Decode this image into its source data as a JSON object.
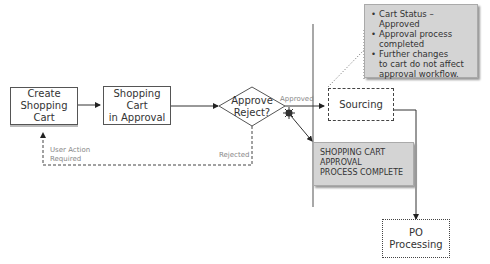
{
  "nodes": {
    "create_cart": {
      "label_line1": "Create",
      "label_line2": "Shopping Cart"
    },
    "cart_in_approval": {
      "label_line1": "Shopping Cart",
      "label_line2": "in Approval"
    },
    "decision": {
      "label_line1": "Approve",
      "label_line2": "Reject?"
    },
    "sourcing": {
      "label": "Sourcing"
    },
    "po_processing": {
      "label": "PO Processing"
    },
    "complete": {
      "line1": "SHOPPING CART",
      "line2": "APPROVAL",
      "line3": "PROCESS COMPLETE"
    }
  },
  "edges": {
    "approved_label": "Approved",
    "rejected_label": "Rejected",
    "user_action_line1": "User Action",
    "user_action_line2": "Required"
  },
  "note": {
    "items": [
      "Cart Status – Approved",
      "Approval process completed",
      "Further changes to cart  do not affect approval workflow."
    ],
    "lines": {
      "i0": "Cart Status – Approved",
      "i1a": "Approval process",
      "i1b": "completed",
      "i2a": "Further changes",
      "i2b": "to cart  do not affect",
      "i2c": "approval workflow."
    }
  },
  "colors": {
    "note_bg": "#d4d4d4",
    "line": "#333333",
    "divider": "#a8a8a8",
    "label_grey": "#888888"
  }
}
